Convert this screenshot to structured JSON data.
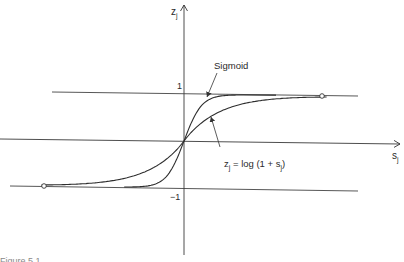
{
  "chart_data": {
    "type": "line",
    "title": "",
    "xlabel": "s",
    "xlabel_sub": "j",
    "ylabel": "z",
    "ylabel_sub": "j",
    "xlim": [
      -3.3,
      4.0
    ],
    "ylim": [
      -2.3,
      2.8
    ],
    "y_ticks": [
      {
        "value": 1,
        "label": "1"
      },
      {
        "value": -1,
        "label": "-1"
      }
    ],
    "reference_lines": [
      {
        "name": "upper-asymptote",
        "y": 1
      },
      {
        "name": "lower-asymptote",
        "y": -1
      }
    ],
    "series": [
      {
        "name": "Sigmoid",
        "function": "tanh-like",
        "x_range": [
          -0.7,
          0.7
        ]
      },
      {
        "name": "log",
        "function": "sign(s)*log(1+|s|) scaled",
        "x_range": [
          -3.0,
          3.0
        ]
      }
    ],
    "endpoints": [
      {
        "x": 2.95,
        "y": 1.0
      },
      {
        "x": -3.0,
        "y": -1.0
      }
    ],
    "annotations": [
      {
        "text": "Sigmoid",
        "target_series": "Sigmoid"
      },
      {
        "text_parts": [
          "z",
          "j",
          " = log (1 + s",
          "j",
          ")"
        ],
        "target_series": "log"
      }
    ],
    "grid": false,
    "legend": "none"
  },
  "labels": {
    "sigmoid": "Sigmoid",
    "log_z": "z",
    "log_sub1": "j",
    "log_mid": " = log (1 + s",
    "log_sub2": "j",
    "log_end": ")",
    "tick_one": "1",
    "tick_minus_one": "−1",
    "x_axis": "s",
    "x_axis_sub": "j",
    "y_axis": "z",
    "y_axis_sub": "j"
  },
  "caption": "Figure 5.1"
}
